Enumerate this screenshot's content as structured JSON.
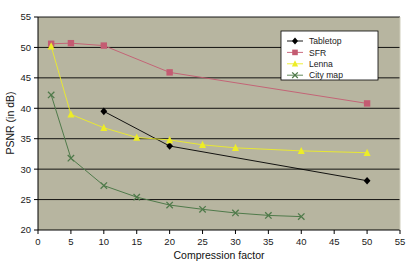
{
  "chart_data": {
    "type": "line",
    "title": "",
    "xlabel": "Compression factor",
    "ylabel": "PSNR (in dB)",
    "xlim": [
      0,
      55
    ],
    "ylim": [
      20,
      55
    ],
    "xticks": [
      0,
      5,
      10,
      15,
      20,
      25,
      30,
      35,
      40,
      45,
      50,
      55
    ],
    "yticks": [
      20,
      25,
      30,
      35,
      40,
      45,
      50,
      55
    ],
    "xtick_labels": [
      "0",
      "5",
      "10",
      "15",
      "20",
      "25",
      "30",
      "35",
      "40",
      "45",
      "50",
      "55"
    ],
    "ytick_labels": [
      "20",
      "25",
      "30",
      "35",
      "40",
      "45",
      "50",
      "55"
    ],
    "grid": "horizontal",
    "legend_position": "top-right",
    "plot_background": "#b7b5a0",
    "grid_color": "#000000",
    "series": [
      {
        "name": "Tabletop",
        "color": "#000000",
        "marker": "diamond",
        "x": [
          10,
          20,
          50
        ],
        "values": [
          39.5,
          33.8,
          28.1
        ]
      },
      {
        "name": "SFR",
        "color": "#c45b72",
        "marker": "square",
        "x": [
          2,
          5,
          10,
          20,
          50
        ],
        "values": [
          50.6,
          50.7,
          50.3,
          45.9,
          40.8
        ]
      },
      {
        "name": "Lenna",
        "color": "#eded26",
        "marker": "triangle",
        "x": [
          2,
          5,
          10,
          15,
          20,
          25,
          30,
          40,
          50
        ],
        "values": [
          50.2,
          39.0,
          36.8,
          35.2,
          34.8,
          34.0,
          33.5,
          33.0,
          32.7
        ]
      },
      {
        "name": "City map",
        "color": "#4f7a4a",
        "marker": "x",
        "x": [
          2,
          5,
          10,
          15,
          20,
          25,
          30,
          35,
          40
        ],
        "values": [
          42.2,
          31.8,
          27.3,
          25.4,
          24.1,
          23.4,
          22.8,
          22.4,
          22.2
        ]
      }
    ]
  },
  "legend": {
    "items": [
      {
        "label": "Tabletop"
      },
      {
        "label": "SFR"
      },
      {
        "label": "Lenna"
      },
      {
        "label": "City map"
      }
    ]
  }
}
